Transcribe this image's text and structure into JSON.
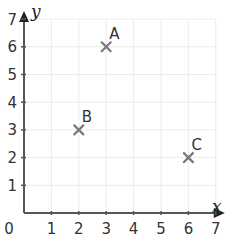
{
  "chart_data": {
    "type": "scatter",
    "title": "",
    "xlabel": "x",
    "ylabel": "y",
    "xlim": [
      0,
      7
    ],
    "ylim": [
      0,
      7
    ],
    "grid": true,
    "legend": null,
    "x_ticks": [
      "1",
      "2",
      "3",
      "4",
      "5",
      "6",
      "7"
    ],
    "y_ticks": [
      "1",
      "2",
      "3",
      "4",
      "5",
      "6",
      "7"
    ],
    "origin_label": "0",
    "points": [
      {
        "label": "A",
        "x": 3,
        "y": 6
      },
      {
        "label": "B",
        "x": 2,
        "y": 3
      },
      {
        "label": "C",
        "x": 6,
        "y": 2
      }
    ],
    "marker": "x",
    "colors": {
      "grid": "#ececec",
      "axis": "#555555",
      "marker": "#7a7a7a",
      "text": "#333333"
    }
  }
}
